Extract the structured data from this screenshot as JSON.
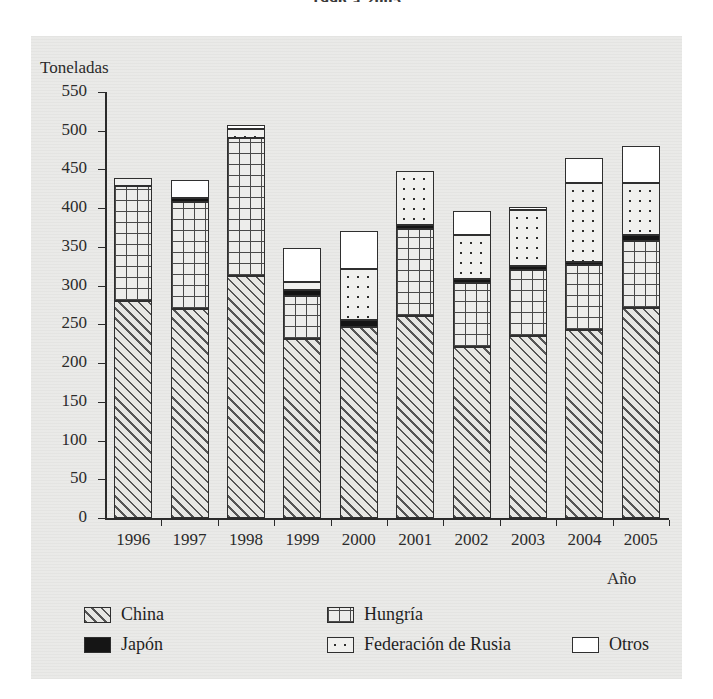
{
  "chart_title": "1996 a 2005",
  "axis": {
    "ylabel": "Toneladas",
    "xlabel": "Año",
    "yticks": [
      "0",
      "50",
      "100",
      "150",
      "200",
      "250",
      "300",
      "350",
      "400",
      "450",
      "500",
      "550"
    ],
    "ymin": 0,
    "ymax": 550
  },
  "legend": {
    "items": [
      {
        "label": "China",
        "swatch": "diagonal-hatch-swatch",
        "color": "#e7e7e4"
      },
      {
        "label": "Japón",
        "swatch": "solid-black-swatch",
        "color": "#151515"
      },
      {
        "label": "Hungría",
        "swatch": "grid-hatch-swatch",
        "color": "#ededeb"
      },
      {
        "label": "Federación de Rusia",
        "swatch": "dotted-swatch",
        "color": "#f0f0ee"
      },
      {
        "label": "Otros",
        "swatch": "white-swatch",
        "color": "#ffffff"
      }
    ]
  },
  "chart_data": {
    "type": "bar",
    "stacked": true,
    "title": "1996 a 2005",
    "xlabel": "Año",
    "ylabel": "Toneladas",
    "ylim": [
      0,
      550
    ],
    "ytick_step": 50,
    "grid": false,
    "legend_position": "bottom",
    "categories": [
      "1996",
      "1997",
      "1998",
      "1999",
      "2000",
      "2001",
      "2002",
      "2003",
      "2004",
      "2005"
    ],
    "series": [
      {
        "name": "China",
        "values": [
          280,
          270,
          312,
          231,
          247,
          261,
          221,
          235,
          243,
          271
        ]
      },
      {
        "name": "Hungría",
        "values": [
          148,
          138,
          179,
          55,
          0,
          112,
          82,
          85,
          84,
          86
        ]
      },
      {
        "name": "Japón",
        "values": [
          0,
          5,
          0,
          8,
          9,
          5,
          5,
          5,
          4,
          8
        ]
      },
      {
        "name": "Federación de Rusia",
        "values": [
          11,
          0,
          11,
          11,
          66,
          70,
          57,
          73,
          102,
          67
        ]
      },
      {
        "name": "Otros",
        "values": [
          0,
          24,
          6,
          43,
          49,
          0,
          31,
          3,
          32,
          48
        ]
      }
    ],
    "totals": [
      439,
      437,
      508,
      348,
      371,
      448,
      396,
      401,
      465,
      480
    ]
  },
  "bars": [
    {
      "year": "1996",
      "segments": [
        {
          "name": "China",
          "bottom": 0,
          "top": 280
        },
        {
          "name": "Hungría",
          "bottom": 280,
          "top": 428
        },
        {
          "name": "Federación de Rusia",
          "bottom": 428,
          "top": 439
        }
      ]
    },
    {
      "year": "1997",
      "segments": [
        {
          "name": "China",
          "bottom": 0,
          "top": 270
        },
        {
          "name": "Hungría",
          "bottom": 270,
          "top": 408
        },
        {
          "name": "Japón",
          "bottom": 408,
          "top": 413
        },
        {
          "name": "Otros",
          "bottom": 413,
          "top": 437
        }
      ]
    },
    {
      "year": "1998",
      "segments": [
        {
          "name": "China",
          "bottom": 0,
          "top": 312
        },
        {
          "name": "Hungría",
          "bottom": 312,
          "top": 491
        },
        {
          "name": "Federación de Rusia",
          "bottom": 491,
          "top": 502
        },
        {
          "name": "Otros",
          "bottom": 502,
          "top": 508
        }
      ]
    },
    {
      "year": "1999",
      "segments": [
        {
          "name": "China",
          "bottom": 0,
          "top": 231
        },
        {
          "name": "Hungría",
          "bottom": 231,
          "top": 286
        },
        {
          "name": "Japón",
          "bottom": 286,
          "top": 294
        },
        {
          "name": "Federación de Rusia",
          "bottom": 294,
          "top": 305
        },
        {
          "name": "Otros",
          "bottom": 305,
          "top": 348
        }
      ]
    },
    {
      "year": "2000",
      "segments": [
        {
          "name": "China",
          "bottom": 0,
          "top": 247
        },
        {
          "name": "Japón",
          "bottom": 247,
          "top": 256
        },
        {
          "name": "Federación de Rusia",
          "bottom": 256,
          "top": 322
        },
        {
          "name": "Otros",
          "bottom": 322,
          "top": 371
        }
      ]
    },
    {
      "year": "2001",
      "segments": [
        {
          "name": "China",
          "bottom": 0,
          "top": 261
        },
        {
          "name": "Hungría",
          "bottom": 261,
          "top": 373
        },
        {
          "name": "Japón",
          "bottom": 373,
          "top": 378
        },
        {
          "name": "Federación de Rusia",
          "bottom": 378,
          "top": 448
        }
      ]
    },
    {
      "year": "2002",
      "segments": [
        {
          "name": "China",
          "bottom": 0,
          "top": 221
        },
        {
          "name": "Hungría",
          "bottom": 221,
          "top": 303
        },
        {
          "name": "Japón",
          "bottom": 303,
          "top": 308
        },
        {
          "name": "Federación de Rusia",
          "bottom": 308,
          "top": 365
        },
        {
          "name": "Otros",
          "bottom": 365,
          "top": 396
        }
      ]
    },
    {
      "year": "2003",
      "segments": [
        {
          "name": "China",
          "bottom": 0,
          "top": 235
        },
        {
          "name": "Hungría",
          "bottom": 235,
          "top": 320
        },
        {
          "name": "Japón",
          "bottom": 320,
          "top": 325
        },
        {
          "name": "Federación de Rusia",
          "bottom": 325,
          "top": 398
        },
        {
          "name": "Otros",
          "bottom": 398,
          "top": 401
        }
      ]
    },
    {
      "year": "2004",
      "segments": [
        {
          "name": "China",
          "bottom": 0,
          "top": 243
        },
        {
          "name": "Hungría",
          "bottom": 243,
          "top": 327
        },
        {
          "name": "Japón",
          "bottom": 327,
          "top": 331
        },
        {
          "name": "Federación de Rusia",
          "bottom": 331,
          "top": 433
        },
        {
          "name": "Otros",
          "bottom": 433,
          "top": 465
        }
      ]
    },
    {
      "year": "2005",
      "segments": [
        {
          "name": "China",
          "bottom": 0,
          "top": 271
        },
        {
          "name": "Hungría",
          "bottom": 271,
          "top": 357
        },
        {
          "name": "Japón",
          "bottom": 357,
          "top": 365
        },
        {
          "name": "Federación de Rusia",
          "bottom": 365,
          "top": 432
        },
        {
          "name": "Otros",
          "bottom": 432,
          "top": 480
        }
      ]
    }
  ]
}
